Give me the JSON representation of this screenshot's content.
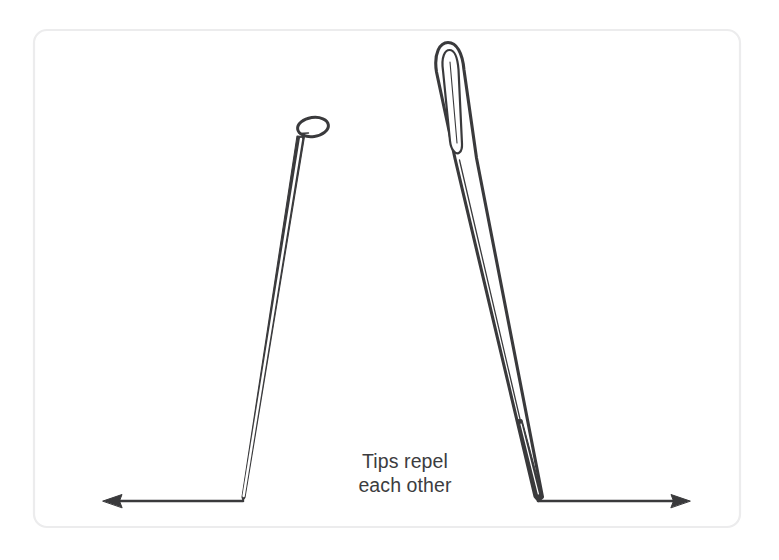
{
  "figure": {
    "background_color": "#ffffff",
    "ink_color": "#3a3a3c",
    "frame": {
      "name": "rounded-panel-border",
      "stroke_color": "#ececed",
      "x": 34,
      "y": 30,
      "width": 706,
      "height": 497,
      "corner_radius": 13,
      "stroke_width": 2.2
    },
    "caption": {
      "line1": "Tips repel",
      "line2": "each other",
      "color": "#3c3c3e",
      "font_size_px": 19.5,
      "center_x": 405,
      "line1_y": 461,
      "line2_y": 485
    },
    "objects": [
      {
        "name": "straight-pin",
        "side": "left",
        "head_type": "flat-oval-pin-head",
        "head_center_x": 313,
        "head_center_y": 127,
        "head_width": 31,
        "head_height": 19,
        "head_rotation_deg": -8,
        "shaft_top_x": 308,
        "shaft_top_y": 137,
        "tip_x": 243,
        "tip_y": 500,
        "shaft_width_top": 9,
        "lean": "tilted right at top, tip at lower left"
      },
      {
        "name": "sewing-needle",
        "side": "right",
        "head_type": "elongated-eye",
        "eye_top_x": 443,
        "eye_top_y": 43,
        "eye_bottom_x": 456,
        "eye_bottom_y": 170,
        "eye_outer_width": 26,
        "eye_inner_width": 12,
        "tip_x": 538,
        "tip_y": 500,
        "lean": "nearly vertical at top, tip at lower right"
      }
    ],
    "arrows": [
      {
        "name": "left-repulsion-arrow",
        "direction": "left",
        "from_x": 243,
        "from_y": 501,
        "to_x": 103,
        "to_y": 501,
        "label": "repulsion force outward"
      },
      {
        "name": "right-repulsion-arrow",
        "direction": "right",
        "from_x": 538,
        "from_y": 501,
        "to_x": 690,
        "to_y": 501,
        "label": "repulsion force outward"
      }
    ]
  }
}
